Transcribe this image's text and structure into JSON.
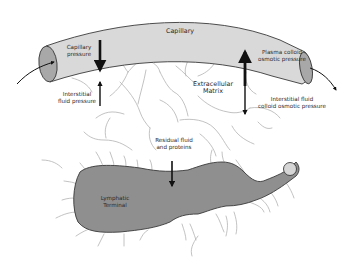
{
  "diagram": {
    "colors": {
      "capillary_body": "#d9d9d9",
      "capillary_end": "#a8a8a8",
      "lymphatic_body": "#8f8f8f",
      "lymphatic_tip": "#d6d6d6",
      "outline": "#3a3a3a",
      "fibers": "#b0b0b0",
      "arrows": "#111111",
      "text": "#2a2a2a"
    },
    "labels": {
      "capillary": "Capillary",
      "capillary_pressure": "Capillary\npressure",
      "interstitial_fluid_pressure": "Interstitial\nfluid pressure",
      "plasma_colloid_osmotic_pressure": "Plasma colloid\nosmotic pressure",
      "interstitial_fluid_colloid_osmotic_pressure": "Interstitial fluid\ncolloid osmotic pressure",
      "extracellular_matrix": "Extracellular\nMatrix",
      "residual_fluid_and_proteins": "Residual fluid\nand proteins",
      "lymphatic_terminal": "Lymphatic\nTerminal"
    },
    "arrows": [
      {
        "name": "capillary-pressure-arrow",
        "direction": "down"
      },
      {
        "name": "interstitial-fluid-pressure-arrow",
        "direction": "up"
      },
      {
        "name": "plasma-colloid-osmotic-pressure-arrow",
        "direction": "up"
      },
      {
        "name": "interstitial-fluid-colloid-osmotic-pressure-arrow",
        "direction": "down"
      },
      {
        "name": "residual-fluid-arrow",
        "direction": "down"
      },
      {
        "name": "blood-inflow-arrow",
        "direction": "right"
      },
      {
        "name": "blood-outflow-arrow",
        "direction": "down-right"
      }
    ]
  }
}
